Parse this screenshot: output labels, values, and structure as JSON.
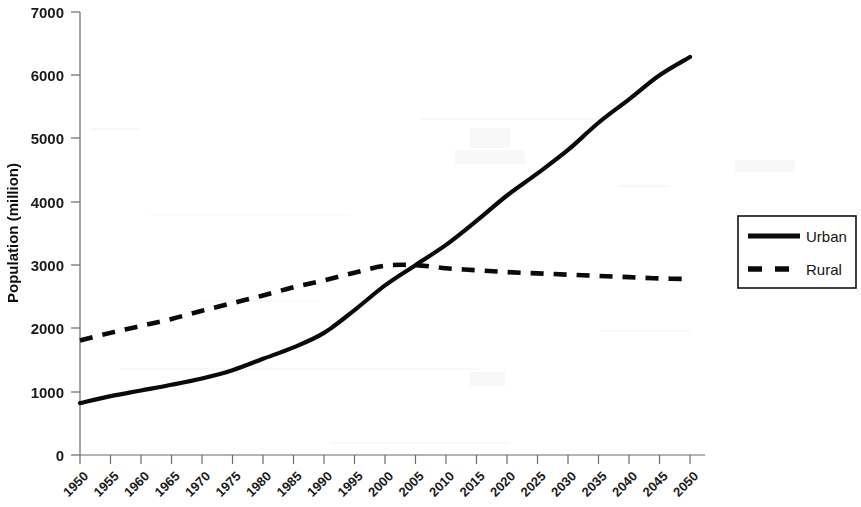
{
  "chart_data": {
    "type": "line",
    "title": "",
    "xlabel": "",
    "ylabel": "Population (million)",
    "categories": [
      "1950",
      "1955",
      "1960",
      "1965",
      "1970",
      "1975",
      "1980",
      "1985",
      "1990",
      "1995",
      "2000",
      "2005",
      "2010",
      "2015",
      "2020",
      "2025",
      "2030",
      "2035",
      "2040",
      "2045",
      "2050"
    ],
    "series": [
      {
        "name": "Urban",
        "style": "solid",
        "values": [
          820,
          930,
          1020,
          1110,
          1210,
          1340,
          1520,
          1700,
          1930,
          2290,
          2680,
          3000,
          3320,
          3700,
          4100,
          4450,
          4820,
          5250,
          5620,
          6000,
          6290
        ]
      },
      {
        "name": "Rural",
        "style": "dashed",
        "values": [
          1810,
          1930,
          2040,
          2150,
          2280,
          2400,
          2520,
          2650,
          2760,
          2880,
          2990,
          3000,
          2950,
          2920,
          2890,
          2870,
          2850,
          2830,
          2810,
          2790,
          2780
        ]
      }
    ],
    "ylim": [
      0,
      7000
    ],
    "yticks": [
      0,
      1000,
      2000,
      3000,
      4000,
      5000,
      6000,
      7000
    ],
    "xlim": [
      1950,
      2050
    ],
    "grid": false,
    "legend_position": "right",
    "colors": {
      "urban": "#0a0a0a",
      "rural": "#0a0a0a",
      "axis": "#6b6b6b",
      "background": "#ffffff"
    }
  },
  "axes": {
    "y_title": "Population (million)",
    "y_tick_labels": [
      "7000",
      "6000",
      "5000",
      "4000",
      "3000",
      "2000",
      "1000",
      "0"
    ],
    "x_tick_labels": [
      "1950",
      "1955",
      "1960",
      "1965",
      "1970",
      "1975",
      "1980",
      "1985",
      "1990",
      "1995",
      "2000",
      "2005",
      "2010",
      "2015",
      "2020",
      "2025",
      "2030",
      "2035",
      "2040",
      "2045",
      "2050"
    ]
  },
  "legend": {
    "items": [
      {
        "label": "Urban",
        "style": "solid"
      },
      {
        "label": "Rural",
        "style": "dashed"
      }
    ]
  }
}
